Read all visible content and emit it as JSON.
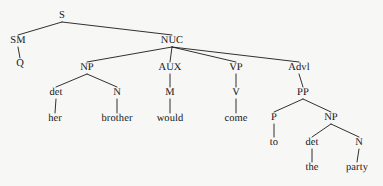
{
  "diagram": {
    "type": "syntax-tree",
    "sentence": "Q her brother would come to the party",
    "background_color": "#f7f7f6",
    "line_color": "#1a1a1a",
    "text_color": "#141414",
    "nodes": [
      {
        "id": "S",
        "label": "S",
        "kind": "category",
        "x": 62,
        "y": 16
      },
      {
        "id": "SM",
        "label": "SM",
        "kind": "category",
        "x": 18,
        "y": 41
      },
      {
        "id": "Q",
        "label": "Q",
        "kind": "category",
        "x": 20,
        "y": 64
      },
      {
        "id": "NUC",
        "label": "NUC",
        "kind": "category",
        "x": 172,
        "y": 41
      },
      {
        "id": "NP1",
        "label": "NP",
        "kind": "category",
        "x": 87,
        "y": 68
      },
      {
        "id": "AUX",
        "label": "AUX",
        "kind": "category",
        "x": 170,
        "y": 68
      },
      {
        "id": "VP",
        "label": "VP",
        "kind": "category",
        "x": 236,
        "y": 68
      },
      {
        "id": "Advl",
        "label": "Advl",
        "kind": "category",
        "x": 299,
        "y": 68
      },
      {
        "id": "det1",
        "label": "det",
        "kind": "category",
        "x": 56,
        "y": 93
      },
      {
        "id": "N1",
        "label": "N",
        "kind": "category",
        "x": 117,
        "y": 93
      },
      {
        "id": "M",
        "label": "M",
        "kind": "category",
        "x": 170,
        "y": 93
      },
      {
        "id": "V",
        "label": "V",
        "kind": "category",
        "x": 236,
        "y": 93
      },
      {
        "id": "PP",
        "label": "PP",
        "kind": "category",
        "x": 303,
        "y": 93
      },
      {
        "id": "her",
        "label": "her",
        "kind": "leaf",
        "x": 55,
        "y": 119
      },
      {
        "id": "brother",
        "label": "brother",
        "kind": "leaf",
        "x": 117,
        "y": 119
      },
      {
        "id": "would",
        "label": "would",
        "kind": "leaf",
        "x": 170,
        "y": 119
      },
      {
        "id": "come",
        "label": "come",
        "kind": "leaf",
        "x": 236,
        "y": 119
      },
      {
        "id": "P",
        "label": "P",
        "kind": "category",
        "x": 274,
        "y": 118
      },
      {
        "id": "NP2",
        "label": "NP",
        "kind": "category",
        "x": 331,
        "y": 118
      },
      {
        "id": "to",
        "label": "to",
        "kind": "leaf",
        "x": 274,
        "y": 143
      },
      {
        "id": "det2",
        "label": "det",
        "kind": "category",
        "x": 312,
        "y": 143
      },
      {
        "id": "N2",
        "label": "N",
        "kind": "category",
        "x": 359,
        "y": 143
      },
      {
        "id": "the",
        "label": "the",
        "kind": "leaf",
        "x": 312,
        "y": 168
      },
      {
        "id": "party",
        "label": "party",
        "kind": "leaf",
        "x": 357,
        "y": 168
      }
    ],
    "edges": [
      {
        "from": "S",
        "to": "SM"
      },
      {
        "from": "S",
        "to": "NUC"
      },
      {
        "from": "SM",
        "to": "Q"
      },
      {
        "from": "NUC",
        "to": "NP1"
      },
      {
        "from": "NUC",
        "to": "AUX"
      },
      {
        "from": "NUC",
        "to": "VP"
      },
      {
        "from": "NUC",
        "to": "Advl"
      },
      {
        "from": "NP1",
        "to": "det1"
      },
      {
        "from": "NP1",
        "to": "N1"
      },
      {
        "from": "AUX",
        "to": "M"
      },
      {
        "from": "VP",
        "to": "V"
      },
      {
        "from": "Advl",
        "to": "PP"
      },
      {
        "from": "det1",
        "to": "her"
      },
      {
        "from": "N1",
        "to": "brother"
      },
      {
        "from": "M",
        "to": "would"
      },
      {
        "from": "V",
        "to": "come"
      },
      {
        "from": "PP",
        "to": "P"
      },
      {
        "from": "PP",
        "to": "NP2"
      },
      {
        "from": "P",
        "to": "to"
      },
      {
        "from": "NP2",
        "to": "det2"
      },
      {
        "from": "NP2",
        "to": "N2"
      },
      {
        "from": "det2",
        "to": "the"
      },
      {
        "from": "N2",
        "to": "party"
      }
    ]
  }
}
